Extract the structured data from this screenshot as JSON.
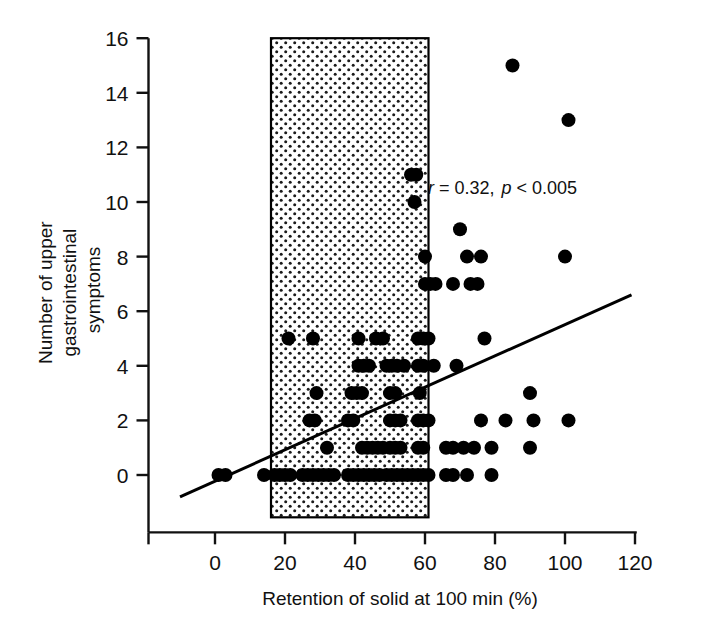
{
  "chart_data": {
    "type": "scatter",
    "title": "",
    "xlabel": "Retention of solid at 100 min (%)",
    "ylabel": "Number of upper gastrointestinal symptoms",
    "ylabel_lines": [
      "Number of upper",
      "gastrointestinal",
      "symptoms"
    ],
    "xlim": [
      -10,
      120
    ],
    "ylim": [
      -1.6,
      16
    ],
    "xticks": [
      0,
      20,
      40,
      60,
      80,
      100,
      120
    ],
    "xtick_labels": [
      "0",
      "20",
      "40",
      "60",
      "80",
      "100",
      "120"
    ],
    "yticks": [
      0,
      2,
      4,
      6,
      8,
      10,
      12,
      14,
      16
    ],
    "ytick_labels": [
      "0",
      "2",
      "4",
      "6",
      "8",
      "10",
      "12",
      "14",
      "16"
    ],
    "grid": false,
    "legend": "none",
    "marker": {
      "shape": "circle",
      "color": "#000000",
      "size_px": 14
    },
    "annotation": {
      "text": "r = 0.32, p < 0.005",
      "r_symbol": "r",
      "r_value": "= 0.32,",
      "p_symbol": "p",
      "p_value": "< 0.005",
      "x": 78,
      "y": 10.3
    },
    "shaded_band": {
      "label": "normal reference range",
      "x_start": 16,
      "x_end": 61,
      "y_start": -1.55,
      "y_end": 16,
      "fill": "#ffffff",
      "pattern": "dotted",
      "pattern_color": "#1a1a1a",
      "border_color": "#000000"
    },
    "regression_line": {
      "x_start": -10,
      "y_start": -0.8,
      "x_end": 119,
      "y_end": 6.6,
      "slope": 0.0574,
      "intercept": -0.226,
      "color": "#000000",
      "width_px": 3
    },
    "points": [
      [
        1,
        0
      ],
      [
        3,
        0
      ],
      [
        14,
        0
      ],
      [
        17,
        0
      ],
      [
        18.5,
        0
      ],
      [
        20,
        0
      ],
      [
        21.5,
        0
      ],
      [
        25,
        0
      ],
      [
        26.5,
        0
      ],
      [
        28,
        0
      ],
      [
        29.5,
        0
      ],
      [
        31,
        0
      ],
      [
        32.5,
        0
      ],
      [
        34,
        0
      ],
      [
        38,
        0
      ],
      [
        39.5,
        0
      ],
      [
        41,
        0
      ],
      [
        42.5,
        0
      ],
      [
        44,
        0
      ],
      [
        45.5,
        0
      ],
      [
        47,
        0
      ],
      [
        49,
        0
      ],
      [
        50.5,
        0
      ],
      [
        52,
        0
      ],
      [
        53.5,
        0
      ],
      [
        55,
        0
      ],
      [
        56.5,
        0
      ],
      [
        58,
        0
      ],
      [
        59.5,
        0
      ],
      [
        61,
        0
      ],
      [
        66,
        0
      ],
      [
        68,
        0
      ],
      [
        72,
        0
      ],
      [
        79,
        0
      ],
      [
        32,
        1
      ],
      [
        42,
        1
      ],
      [
        43.5,
        1
      ],
      [
        45,
        1
      ],
      [
        46.5,
        1
      ],
      [
        48,
        1
      ],
      [
        50,
        1
      ],
      [
        51.5,
        1
      ],
      [
        53,
        1
      ],
      [
        58,
        1
      ],
      [
        59.5,
        1
      ],
      [
        66,
        1
      ],
      [
        68,
        1
      ],
      [
        71,
        1
      ],
      [
        74,
        1
      ],
      [
        79,
        1
      ],
      [
        90,
        1
      ],
      [
        27,
        2
      ],
      [
        28.5,
        2
      ],
      [
        38,
        2
      ],
      [
        39.5,
        2
      ],
      [
        50,
        2
      ],
      [
        51.5,
        2
      ],
      [
        53,
        2
      ],
      [
        58,
        2
      ],
      [
        59.5,
        2
      ],
      [
        61,
        2
      ],
      [
        76,
        2
      ],
      [
        83,
        2
      ],
      [
        91,
        2
      ],
      [
        101,
        2
      ],
      [
        29,
        3
      ],
      [
        39,
        3
      ],
      [
        40.5,
        3
      ],
      [
        42,
        3
      ],
      [
        50,
        3
      ],
      [
        51.5,
        3
      ],
      [
        58.5,
        3
      ],
      [
        90,
        3
      ],
      [
        41,
        4
      ],
      [
        42.5,
        4
      ],
      [
        44,
        4
      ],
      [
        49,
        4
      ],
      [
        50.5,
        4
      ],
      [
        52,
        4
      ],
      [
        54,
        4
      ],
      [
        58,
        4
      ],
      [
        59.5,
        4
      ],
      [
        62.5,
        4
      ],
      [
        69,
        4
      ],
      [
        28,
        5
      ],
      [
        41,
        5
      ],
      [
        46,
        5
      ],
      [
        48,
        5
      ],
      [
        58,
        5
      ],
      [
        59.5,
        5
      ],
      [
        61,
        5
      ],
      [
        77,
        5
      ],
      [
        21,
        5
      ],
      [
        60,
        7
      ],
      [
        61.5,
        7
      ],
      [
        63,
        7
      ],
      [
        68,
        7
      ],
      [
        73,
        7
      ],
      [
        75,
        7
      ],
      [
        60,
        8
      ],
      [
        72,
        8
      ],
      [
        76,
        8
      ],
      [
        100,
        8
      ],
      [
        70,
        9
      ],
      [
        57,
        10
      ],
      [
        56,
        11
      ],
      [
        57.5,
        11
      ],
      [
        101,
        13
      ],
      [
        85,
        15
      ]
    ],
    "point_count": 112
  },
  "figure": {
    "background": "#ffffff",
    "axis_color": "#111111"
  }
}
